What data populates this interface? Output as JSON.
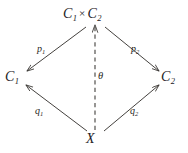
{
  "diagram": {
    "kind": "commutative-diagram",
    "background_color": "#ffffff",
    "line_color": "#3a3734",
    "text_color": "#23201e",
    "nodes": [
      {
        "id": "top",
        "base": "C",
        "sub": "1",
        "times": "×",
        "base2": "C",
        "sub2": "2",
        "full": "C1 × C2",
        "x": 95,
        "y": 15
      },
      {
        "id": "left",
        "base": "C",
        "sub": "1",
        "full": "C1",
        "x": 14,
        "y": 78
      },
      {
        "id": "right",
        "base": "C",
        "sub": "2",
        "full": "C2",
        "x": 170,
        "y": 78
      },
      {
        "id": "bottom",
        "base": "X",
        "sub": "",
        "full": "X",
        "x": 93,
        "y": 140
      }
    ],
    "edges": [
      {
        "id": "p1",
        "base": "p",
        "sub": "1",
        "full": "p1",
        "from": "top",
        "to": "left",
        "style": "solid",
        "arrow": "end"
      },
      {
        "id": "p2",
        "base": "p",
        "sub": "2",
        "full": "p2",
        "from": "top",
        "to": "right",
        "style": "solid",
        "arrow": "end"
      },
      {
        "id": "q1",
        "base": "q",
        "sub": "1",
        "full": "q1",
        "from": "bottom",
        "to": "left",
        "style": "solid",
        "arrow": "end"
      },
      {
        "id": "q2",
        "base": "q",
        "sub": "2",
        "full": "q2",
        "from": "bottom",
        "to": "right",
        "style": "solid",
        "arrow": "end"
      },
      {
        "id": "theta",
        "base": "θ",
        "sub": "",
        "full": "θ",
        "from": "bottom",
        "to": "top",
        "style": "dashed",
        "arrow": "end"
      }
    ]
  }
}
